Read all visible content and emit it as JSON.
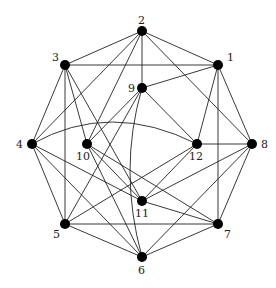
{
  "diagram": {
    "type": "graph",
    "nodes": [
      {
        "id": "1",
        "x": 218,
        "y": 65,
        "lx": 227,
        "ly": 61
      },
      {
        "id": "2",
        "x": 142,
        "y": 31,
        "lx": 138,
        "ly": 24
      },
      {
        "id": "3",
        "x": 65,
        "y": 65,
        "lx": 52,
        "ly": 61
      },
      {
        "id": "4",
        "x": 32,
        "y": 144,
        "lx": 16,
        "ly": 148
      },
      {
        "id": "5",
        "x": 65,
        "y": 224,
        "lx": 53,
        "ly": 238
      },
      {
        "id": "6",
        "x": 142,
        "y": 257,
        "lx": 138,
        "ly": 274
      },
      {
        "id": "7",
        "x": 218,
        "y": 224,
        "lx": 224,
        "ly": 238
      },
      {
        "id": "8",
        "x": 252,
        "y": 144,
        "lx": 261,
        "ly": 148
      },
      {
        "id": "9",
        "x": 142,
        "y": 88,
        "lx": 128,
        "ly": 92
      },
      {
        "id": "10",
        "x": 87,
        "y": 144,
        "lx": 76,
        "ly": 160
      },
      {
        "id": "11",
        "x": 142,
        "y": 201,
        "lx": 135,
        "ly": 217
      },
      {
        "id": "12",
        "x": 197,
        "y": 144,
        "lx": 189,
        "ly": 160
      }
    ],
    "edges": [
      [
        "2",
        "3"
      ],
      [
        "2",
        "1"
      ],
      [
        "2",
        "9"
      ],
      [
        "2",
        "4"
      ],
      [
        "2",
        "10"
      ],
      [
        "2",
        "8"
      ],
      [
        "1",
        "3"
      ],
      [
        "1",
        "9"
      ],
      [
        "1",
        "12"
      ],
      [
        "1",
        "7"
      ],
      [
        "1",
        "8"
      ],
      [
        "3",
        "4"
      ],
      [
        "3",
        "5"
      ],
      [
        "3",
        "10"
      ],
      [
        "3",
        "11"
      ],
      [
        "9",
        "10"
      ],
      [
        "9",
        "5"
      ],
      [
        "9",
        "12"
      ],
      [
        "4",
        "5"
      ],
      [
        "4",
        "6"
      ],
      [
        "4",
        "11"
      ],
      [
        "10",
        "11"
      ],
      [
        "10",
        "6"
      ],
      [
        "10",
        "7"
      ],
      [
        "12",
        "8"
      ],
      [
        "12",
        "11"
      ],
      [
        "12",
        "5"
      ],
      [
        "8",
        "7"
      ],
      [
        "8",
        "11"
      ],
      [
        "8",
        "6"
      ],
      [
        "5",
        "7"
      ],
      [
        "5",
        "6"
      ],
      [
        "7",
        "6"
      ],
      [
        "7",
        "11"
      ]
    ],
    "curved_edges": [
      {
        "from": "4",
        "to": "12",
        "cx": 110,
        "cy": 100
      },
      {
        "from": "9",
        "to": "6",
        "cx": 118,
        "cy": 170
      }
    ]
  }
}
